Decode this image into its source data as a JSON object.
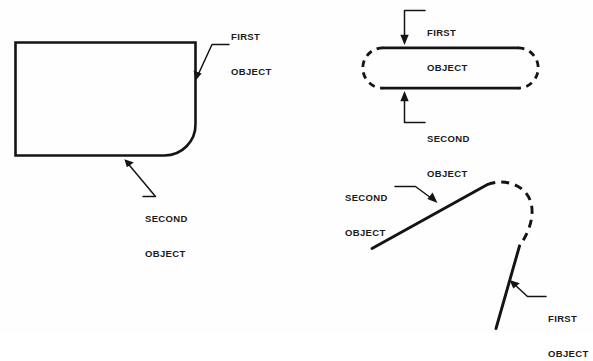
{
  "figure": {
    "background_color": "#fefefe",
    "line_color": "#141414",
    "text_color": "#1b1b1b"
  },
  "diagrams": [
    {
      "id": "rectangle-filleted-corner",
      "name": "Rectangle with filleted bottom-right corner",
      "labels": [
        {
          "id": "first-object",
          "line1": "FIRST",
          "line2": "OBJECT"
        },
        {
          "id": "second-object",
          "line1": "SECOND",
          "line2": "OBJECT"
        }
      ]
    },
    {
      "id": "stadium-dashed-caps",
      "name": "Stadium shape with dashed end caps",
      "labels": [
        {
          "id": "first-object",
          "line1": "FIRST",
          "line2": "OBJECT"
        },
        {
          "id": "second-object",
          "line1": "SECOND",
          "line2": "OBJECT"
        }
      ]
    },
    {
      "id": "two-lines-dashed-arc",
      "name": "Two lines joined by dashed arc",
      "labels": [
        {
          "id": "second-object",
          "line1": "SECOND",
          "line2": "OBJECT"
        },
        {
          "id": "first-object",
          "line1": "FIRST",
          "line2": "OBJECT"
        }
      ]
    }
  ],
  "labels": {
    "d1_first_l1": "FIRST",
    "d1_first_l2": "OBJECT",
    "d1_second_l1": "SECOND",
    "d1_second_l2": "OBJECT",
    "d2_first_l1": "FIRST",
    "d2_first_l2": "OBJECT",
    "d2_second_l1": "SECOND",
    "d2_second_l2": "OBJECT",
    "d3_second_l1": "SECOND",
    "d3_second_l2": "OBJECT",
    "d3_first_l1": "FIRST",
    "d3_first_l2": "OBJECT"
  }
}
